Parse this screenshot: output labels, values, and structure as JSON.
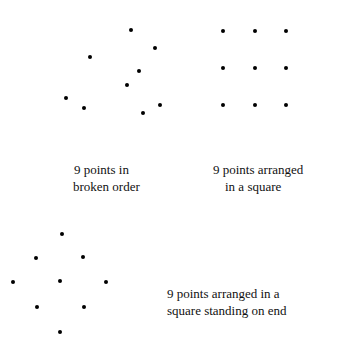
{
  "figure": {
    "panels": [
      {
        "id": "broken-order",
        "caption_lines": [
          "9 points in",
          "broken order"
        ],
        "caption_pos": {
          "x": 73,
          "y": 161
        },
        "caption_indent": [
          1,
          0
        ],
        "points": [
          [
            131,
            30
          ],
          [
            155,
            48
          ],
          [
            90,
            57
          ],
          [
            139,
            71
          ],
          [
            127,
            85
          ],
          [
            66,
            98
          ],
          [
            84,
            108
          ],
          [
            160,
            105
          ],
          [
            143,
            113
          ]
        ]
      },
      {
        "id": "square",
        "caption_lines": [
          "9 points arranged",
          "in a square"
        ],
        "caption_pos": {
          "x": 213,
          "y": 161
        },
        "caption_indent": [
          0,
          12
        ],
        "points": [
          [
            223,
            31
          ],
          [
            255,
            31
          ],
          [
            286,
            31
          ],
          [
            223,
            68
          ],
          [
            255,
            68
          ],
          [
            286,
            68
          ],
          [
            223,
            105
          ],
          [
            255,
            105
          ],
          [
            286,
            105
          ]
        ]
      },
      {
        "id": "diamond",
        "caption_lines": [
          "9 points arranged in a",
          "square standing on end"
        ],
        "caption_pos": {
          "x": 167,
          "y": 285
        },
        "caption_indent": [
          0,
          0
        ],
        "points": [
          [
            62,
            234
          ],
          [
            36,
            258
          ],
          [
            83,
            257
          ],
          [
            13,
            282
          ],
          [
            60,
            281
          ],
          [
            106,
            282
          ],
          [
            37,
            307
          ],
          [
            84,
            307
          ],
          [
            60,
            332
          ]
        ]
      }
    ]
  }
}
